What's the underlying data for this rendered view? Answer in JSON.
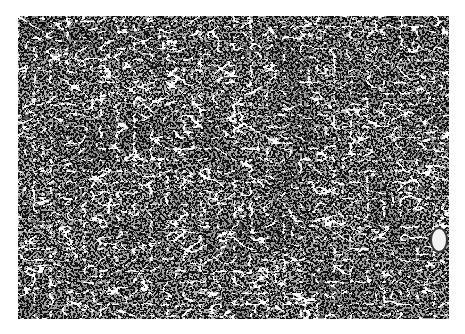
{
  "image": {
    "kind": "grayscale histology micrograph",
    "subject": "dense tissue with darkly stained cell clusters and a network of pale fibrous/capillary strands",
    "colors": {
      "background": "#ffffff",
      "tissue_mid": "#b8b8b8",
      "dark_nuclei": "#2a2a2a",
      "light_strands": "#f0f0f0"
    },
    "features": [
      {
        "name": "vessel-lumen",
        "description": "small pale oval lumen near right edge"
      }
    ]
  }
}
